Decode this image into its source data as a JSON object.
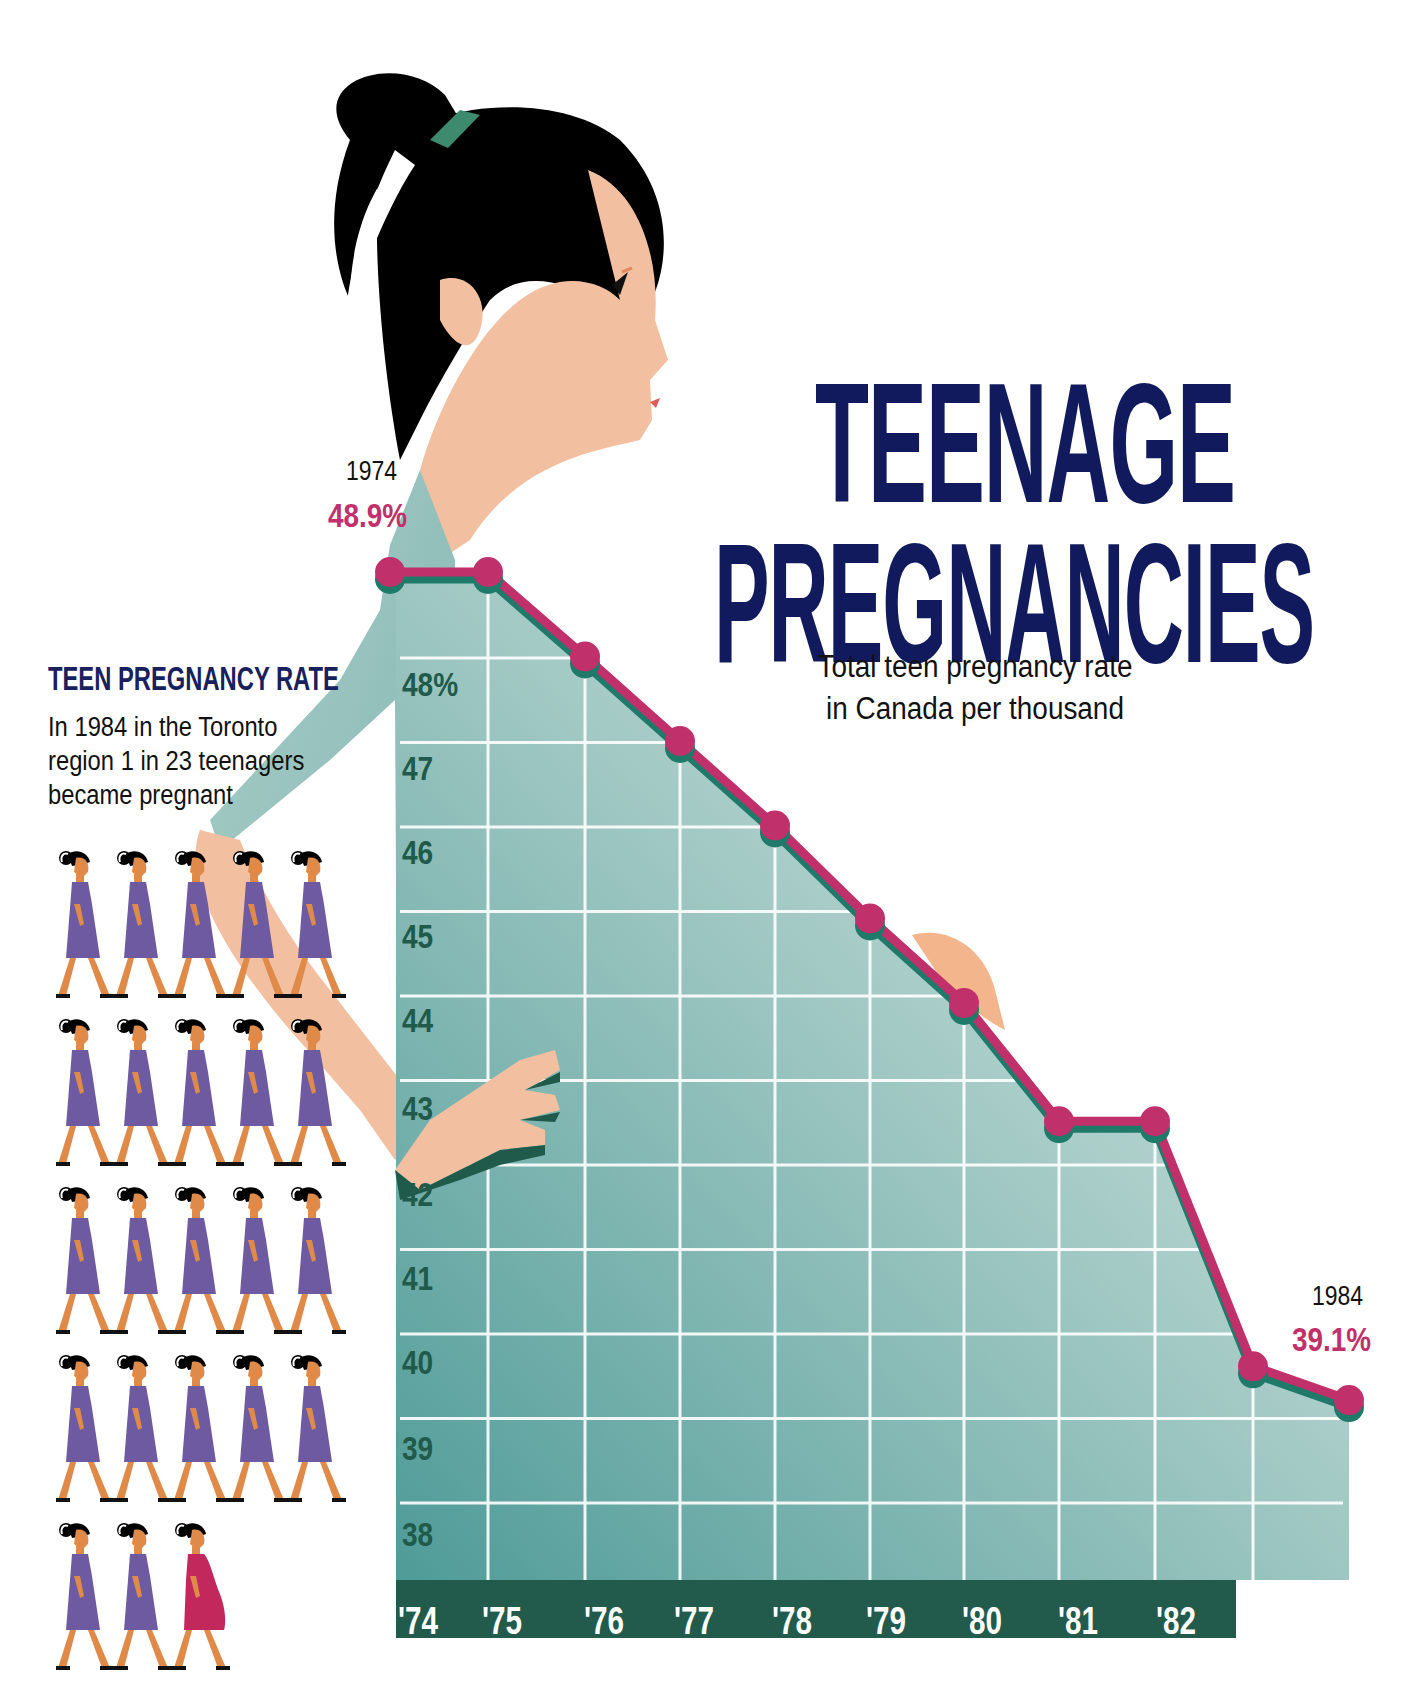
{
  "title": {
    "line1": "TEENAGE",
    "line2": "PREGNANCIES",
    "subtitle_line1": "Total teen pregnancy rate",
    "subtitle_line2": "in Canada per thousand"
  },
  "start_annotation": {
    "year": "1974",
    "value": "48.9%"
  },
  "end_annotation": {
    "year": "1984",
    "value": "39.1%"
  },
  "sidebar": {
    "heading": "TEEN PREGNANCY RATE",
    "text": "In 1984 in the Toronto\nregion 1 in 23 teenagers\nbecame pregnant",
    "figure_count": 23,
    "pregnant_index": 22
  },
  "colors": {
    "line": "#c0306a",
    "shadow": "#1f7a6a",
    "title": "#101a5c",
    "axis_bar": "#225a4c",
    "tick_label": "#1f5a4a",
    "dress": "#6e5aa0",
    "pregnant_dress": "#c2285c",
    "skin": "#f2b992"
  },
  "chart_data": {
    "type": "area",
    "subtitle": "Total teen pregnancy rate in Canada per thousand",
    "xlabel": "",
    "ylabel": "",
    "categories": [
      "'74",
      "'75",
      "'76",
      "'77",
      "'78",
      "'79",
      "'80",
      "'81",
      "'82",
      "'83",
      "'84"
    ],
    "x_tick_labels": [
      "'74",
      "'75",
      "'76",
      "'77",
      "'78",
      "'79",
      "'80",
      "'81",
      "'82",
      "'83"
    ],
    "y_tick_labels": [
      "48%",
      "47",
      "46",
      "45",
      "44",
      "43",
      "42",
      "41",
      "40",
      "39",
      "38"
    ],
    "series": [
      {
        "name": "Teen pregnancy rate",
        "values": [
          48.9,
          48.9,
          47.9,
          46.9,
          45.9,
          44.8,
          43.8,
          42.4,
          42.4,
          39.5,
          39.1
        ]
      }
    ],
    "annotations": [
      {
        "x": "1974",
        "label": "48.9%"
      },
      {
        "x": "1984",
        "label": "39.1%"
      }
    ],
    "ylim": [
      37.5,
      49
    ],
    "grid": true,
    "legend": "none"
  }
}
